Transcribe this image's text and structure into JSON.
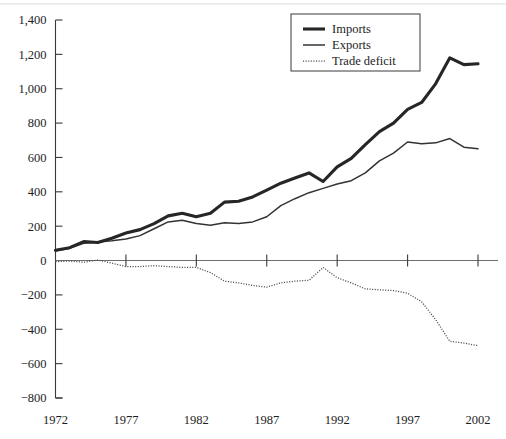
{
  "chart_data": {
    "type": "line",
    "title": "",
    "xlabel": "",
    "ylabel": "",
    "xlim": [
      1972,
      2002
    ],
    "ylim": [
      -800,
      1400
    ],
    "grid": false,
    "legend_position": "top-center",
    "x_ticks": [
      "1972",
      "1977",
      "1982",
      "1987",
      "1992",
      "1997",
      "2002"
    ],
    "x_tick_values": [
      1972,
      1977,
      1982,
      1987,
      1992,
      1997,
      2002
    ],
    "y_ticks": [
      "1,400",
      "1,200",
      "1,000",
      "800",
      "600",
      "400",
      "200",
      "0",
      "−200",
      "−400",
      "−600",
      "−800"
    ],
    "y_tick_values": [
      1400,
      1200,
      1000,
      800,
      600,
      400,
      200,
      0,
      -200,
      -400,
      -600,
      -800
    ],
    "x": [
      1972,
      1973,
      1974,
      1975,
      1976,
      1977,
      1978,
      1979,
      1980,
      1981,
      1982,
      1983,
      1984,
      1985,
      1986,
      1987,
      1988,
      1989,
      1990,
      1991,
      1992,
      1993,
      1994,
      1995,
      1996,
      1997,
      1998,
      1999,
      2000,
      2001,
      2002
    ],
    "series": [
      {
        "name": "Imports",
        "style": "thick-solid",
        "values": [
          60,
          75,
          110,
          105,
          130,
          160,
          180,
          215,
          260,
          275,
          255,
          275,
          340,
          345,
          370,
          410,
          450,
          480,
          510,
          460,
          545,
          595,
          675,
          750,
          800,
          880,
          920,
          1030,
          1180,
          1140,
          1145
        ]
      },
      {
        "name": "Exports",
        "style": "thin-solid",
        "values": [
          55,
          72,
          100,
          108,
          115,
          125,
          145,
          185,
          225,
          235,
          215,
          205,
          220,
          215,
          225,
          255,
          320,
          360,
          395,
          420,
          445,
          465,
          510,
          580,
          625,
          690,
          680,
          685,
          710,
          660,
          650
        ]
      },
      {
        "name": "Trade deficit",
        "style": "dotted",
        "values": [
          -7,
          -3,
          -10,
          3,
          -15,
          -35,
          -35,
          -30,
          -35,
          -40,
          -40,
          -70,
          -120,
          -130,
          -145,
          -155,
          -130,
          -120,
          -115,
          -40,
          -100,
          -130,
          -165,
          -170,
          -175,
          -190,
          -240,
          -345,
          -470,
          -480,
          -495
        ]
      }
    ],
    "legend": [
      {
        "label": "Imports",
        "style": "thick-solid"
      },
      {
        "label": "Exports",
        "style": "thin-solid"
      },
      {
        "label": "Trade deficit",
        "style": "dotted"
      }
    ]
  }
}
